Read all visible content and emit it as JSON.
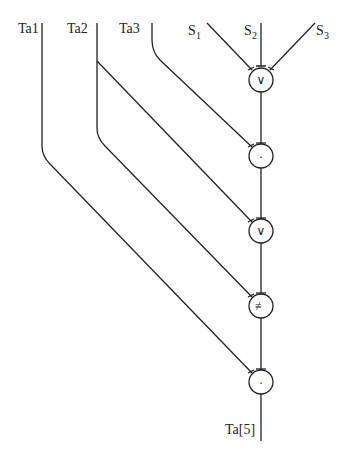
{
  "diagram": {
    "inputs_left": [
      {
        "label": "Ta1"
      },
      {
        "label": "Ta2"
      },
      {
        "label": "Ta3"
      }
    ],
    "inputs_right": [
      {
        "label": "S",
        "sub": "1"
      },
      {
        "label": "S",
        "sub": "2"
      },
      {
        "label": "S",
        "sub": "3"
      }
    ],
    "nodes": [
      {
        "symbol": "∨",
        "name": "or"
      },
      {
        "symbol": "·",
        "name": "and"
      },
      {
        "symbol": "∨",
        "name": "or"
      },
      {
        "symbol": "≢",
        "name": "xor"
      },
      {
        "symbol": "·",
        "name": "and"
      }
    ],
    "output": {
      "label": "Ta[5]"
    }
  }
}
